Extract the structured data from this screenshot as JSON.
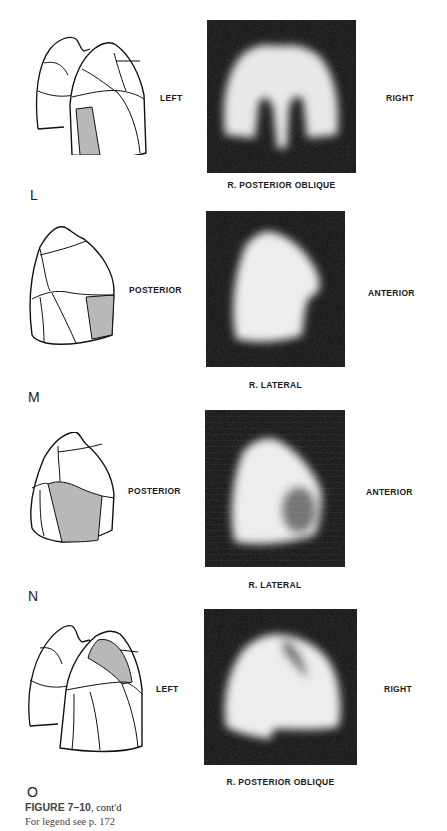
{
  "page": {
    "figure_title": "FIGURE 7–10",
    "figure_suffix": ", cont'd",
    "figure_legend": "For legend see p. 172"
  },
  "panels": [
    {
      "letter": "L",
      "left_label": "LEFT",
      "right_label": "RIGHT",
      "caption": "R. POSTERIOR OBLIQUE",
      "diagram": "both-lungs-posterior-oblique",
      "highlighted_segment": "lower-lobe-middle-segment"
    },
    {
      "letter": "M",
      "left_label": "POSTERIOR",
      "right_label": "ANTERIOR",
      "caption": "R. LATERAL",
      "diagram": "right-lung-lateral",
      "highlighted_segment": "lower-anterior-segment"
    },
    {
      "letter": "N",
      "left_label": "POSTERIOR",
      "right_label": "ANTERIOR",
      "caption": "R. LATERAL",
      "diagram": "right-lung-lateral",
      "highlighted_segment": "middle-lobe-segment"
    },
    {
      "letter": "O",
      "left_label": "LEFT",
      "right_label": "RIGHT",
      "caption": "R. POSTERIOR OBLIQUE",
      "diagram": "both-lungs-posterior-oblique",
      "highlighted_segment": "upper-lobe-anterior-segment"
    }
  ],
  "colors": {
    "scan_background": "#0c0c0c",
    "highlight_fill": "#b8b8b8",
    "outline": "#111111"
  }
}
